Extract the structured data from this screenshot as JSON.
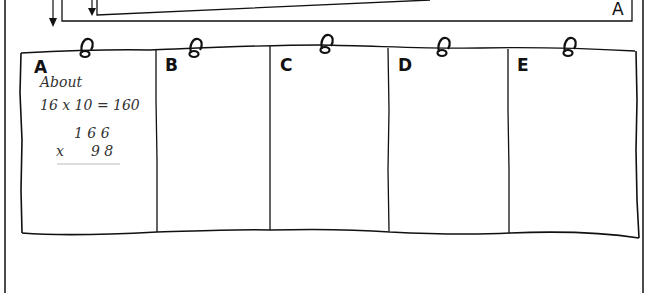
{
  "top_panel": {
    "corner_label": "A"
  },
  "columns": [
    {
      "label": "A"
    },
    {
      "label": "B"
    },
    {
      "label": "C"
    },
    {
      "label": "D"
    },
    {
      "label": "E"
    }
  ],
  "column_a_work": {
    "heading": "About",
    "estimate": "16 x 10 = 160",
    "multiplicand": "1 6 6",
    "multiplier_sign": "x",
    "multiplier": "9 8"
  },
  "icons": {
    "ring": "binder-ring-icon",
    "arrow": "arrow-down-icon"
  },
  "colors": {
    "ink": "#111111",
    "pencil": "#444444",
    "background": "#ffffff"
  }
}
